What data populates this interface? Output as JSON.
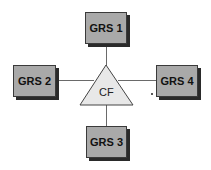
{
  "diagram": {
    "center": {
      "label": "CF",
      "shape": "triangle",
      "fill": "#e8e8e8"
    },
    "nodes": [
      {
        "id": "grs1",
        "label": "GRS 1",
        "position": "top"
      },
      {
        "id": "grs2",
        "label": "GRS 2",
        "position": "left"
      },
      {
        "id": "grs3",
        "label": "GRS 3",
        "position": "bottom"
      },
      {
        "id": "grs4",
        "label": "GRS 4",
        "position": "right"
      }
    ],
    "edges": [
      {
        "from": "CF",
        "to": "GRS 1"
      },
      {
        "from": "CF",
        "to": "GRS 2"
      },
      {
        "from": "CF",
        "to": "GRS 3"
      },
      {
        "from": "CF",
        "to": "GRS 4"
      }
    ],
    "colors": {
      "box_fill": "#a9a9a9",
      "shadow": "#2a2a2a",
      "line": "#6a6a6a"
    }
  }
}
